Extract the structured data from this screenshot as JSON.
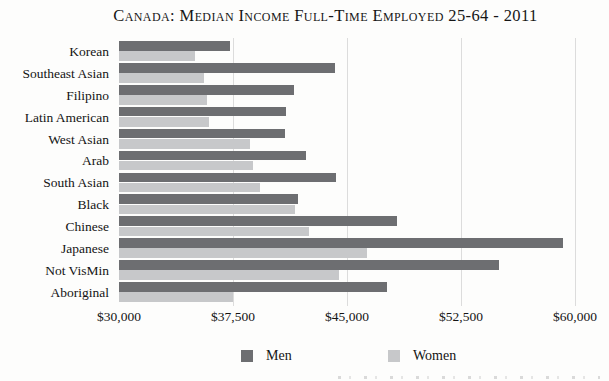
{
  "title": "Canada: Median Income Full-Time Employed 25-64 - 2011",
  "chart_data": {
    "type": "bar",
    "orientation": "horizontal",
    "title": "Canada: Median Income Full-Time Employed 25-64 - 2011",
    "categories": [
      "Korean",
      "Southeast Asian",
      "Filipino",
      "Latin American",
      "West Asian",
      "Arab",
      "South Asian",
      "Black",
      "Chinese",
      "Japanese",
      "Not VisMin",
      "Aboriginal"
    ],
    "series": [
      {
        "name": "Men",
        "color": "#6d6e71",
        "values": [
          37300,
          44200,
          41500,
          41000,
          40900,
          42300,
          44300,
          41800,
          48300,
          59200,
          55000,
          47600
        ]
      },
      {
        "name": "Women",
        "color": "#c7c8ca",
        "values": [
          35000,
          35600,
          35800,
          35900,
          38600,
          38800,
          39300,
          41600,
          42500,
          46300,
          44500,
          37500
        ]
      }
    ],
    "xlabel": "",
    "ylabel": "",
    "xlim": [
      30000,
      60000
    ],
    "xticks": [
      30000,
      37500,
      45000,
      52500,
      60000
    ],
    "xtick_labels": [
      "$30,000",
      "$37,500",
      "$45,000",
      "$52,500",
      "$60,000"
    ],
    "grid": "vertical-gridlines",
    "gridline_color": "#dcdcdc",
    "legend_position": "bottom"
  },
  "legend": {
    "items": [
      {
        "label": "Men",
        "color": "#6d6e71"
      },
      {
        "label": "Women",
        "color": "#c7c8ca"
      }
    ]
  }
}
